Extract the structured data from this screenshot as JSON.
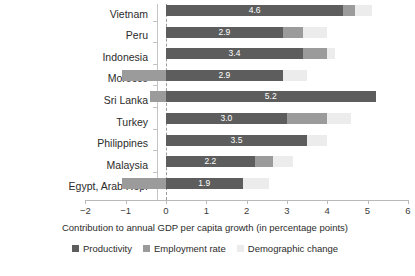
{
  "chart_data": {
    "type": "bar",
    "orientation": "horizontal",
    "stacked": true,
    "title": "",
    "xlabel": "Contribution to annual GDP per capita growth (in percentage points)",
    "ylabel": "",
    "xlim": [
      -2,
      6
    ],
    "xticks": [
      "-2",
      "-1",
      "0",
      "1",
      "2",
      "3",
      "4",
      "5",
      "6"
    ],
    "xtick_values": [
      -2,
      -1,
      0,
      1,
      2,
      3,
      4,
      5,
      6
    ],
    "grid": false,
    "zero_reference_line": true,
    "legend_position": "bottom",
    "categories": [
      "Vietnam",
      "Peru",
      "Indonesia",
      "Morocco",
      "Sri Lanka",
      "Turkey",
      "Philippines",
      "Malaysia",
      "Egypt, Arab Rep."
    ],
    "series": [
      {
        "name": "Productivity",
        "color": "#5d5d5d",
        "values": [
          4.4,
          2.9,
          3.4,
          2.9,
          5.2,
          3.0,
          3.5,
          2.2,
          1.9
        ]
      },
      {
        "name": "Employment rate",
        "color": "#9b9b9b",
        "values": [
          0.3,
          0.5,
          0.6,
          -1.1,
          -0.4,
          1.0,
          0.0,
          0.45,
          -1.1
        ]
      },
      {
        "name": "Demographic change",
        "color": "#ececec",
        "values": [
          0.4,
          0.6,
          0.2,
          0.6,
          0.0,
          0.6,
          0.5,
          0.5,
          0.65
        ]
      }
    ],
    "data_labels": [
      "4.6",
      "2.9",
      "3.4",
      "2.9",
      "5.2",
      "3.0",
      "3.5",
      "2.2",
      "1.9"
    ],
    "data_label_note": "white numeric label centered on the Productivity segment of each bar"
  },
  "legend": {
    "items": [
      {
        "label": "Productivity",
        "color": "#5d5d5d"
      },
      {
        "label": "Employment rate",
        "color": "#9b9b9b"
      },
      {
        "label": "Demographic change",
        "color": "#ececec"
      }
    ]
  },
  "axis": {
    "x_title": "Contribution to annual GDP per capita growth (in percentage points)"
  },
  "source": {
    "text": ""
  }
}
